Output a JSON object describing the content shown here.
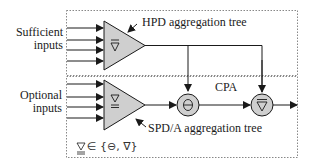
{
  "diagram": {
    "left_labels": {
      "sufficient": [
        "Sufficient",
        "inputs"
      ],
      "optional": [
        "Optional",
        "inputs"
      ]
    },
    "hpd_tree_label": "HPD aggregation tree",
    "spd_tree_label": "SPD/A aggregation tree",
    "cpa_label": "CPA",
    "legend": "∇ ∈ {⊖, ∇}",
    "operators": {
      "hpd_triangle_symbol": "∇",
      "spd_triangle_symbol": "∇",
      "circle_1_symbol": "⊖",
      "circle_2_symbol": "∇"
    },
    "colors": {
      "node_fill": "#cfcfcf",
      "stroke": "#1a1a1a",
      "box_border": "#888888"
    }
  }
}
